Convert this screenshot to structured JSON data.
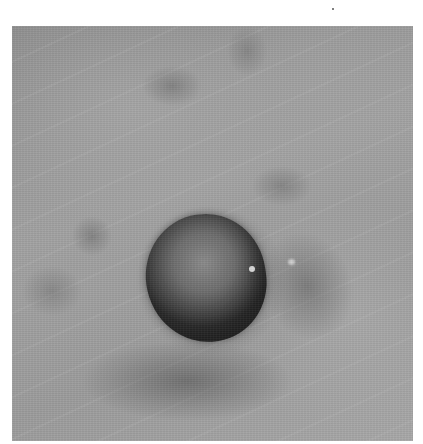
{
  "image": {
    "description": "Grayscale clinical photograph of a skin surface showing a dark, smooth, dome-shaped nodule in the center surrounded by wrinkled skin with scattered darker patches",
    "colors": {
      "background": "#ffffff",
      "skin": "#9c9c9c",
      "nodule": "#4a4a4a"
    }
  }
}
